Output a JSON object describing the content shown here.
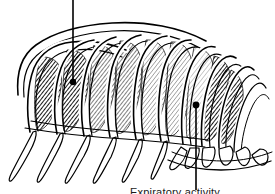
{
  "figure": {
    "view": "lateral oblique",
    "style": "black and white line drawing with diagonal hatching",
    "background_color": "#ffffff",
    "ink_color": "#000000",
    "hatch_color": "#222222"
  },
  "annotations": {
    "top": {
      "label": "",
      "leader_note": "leader line runs off the top edge of the image to an off-screen caption",
      "dot_x": 73,
      "dot_y": 82,
      "line_top_x": 73,
      "line_top_y": 0
    },
    "bottom": {
      "label": "Expiratory activity",
      "leader_note": "leader line runs from a dot on the lower intercostal space down to the caption",
      "dot_x": 196,
      "dot_y": 105,
      "line_bottom_x": 196,
      "line_bottom_y": 190
    }
  },
  "caption": {
    "bottom_text": "Expiratory activity"
  },
  "anatomy": {
    "parts": [
      "ribs",
      "intercostal muscles",
      "costal cartilages",
      "costal margin"
    ],
    "rib_count_drawn": 11,
    "hatched_spaces": 9
  }
}
